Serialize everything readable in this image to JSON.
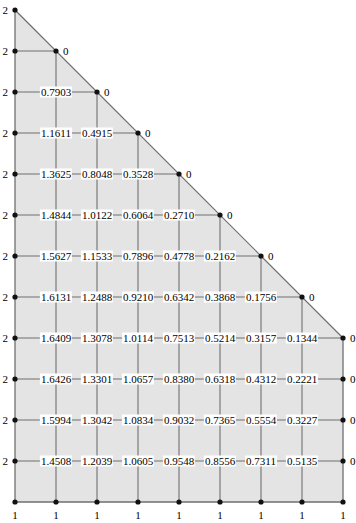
{
  "figure": {
    "type": "mesh-plot",
    "width": 356,
    "height": 523,
    "fill_color": "#e4e4e4",
    "line_color": "#6f6f6f",
    "node_color": "#111111",
    "text_color": "#000000"
  },
  "geometry": {
    "columns_x": [
      15,
      56,
      97,
      138,
      179,
      220,
      261,
      302,
      343
    ],
    "rows_y": [
      10,
      51,
      92,
      133,
      174,
      215,
      256,
      297,
      338,
      379,
      420,
      461,
      502
    ],
    "hypotenuse": {
      "from_col": 0,
      "from_row": 0,
      "to_col": 8,
      "to_row": 8
    }
  },
  "chart_data": {
    "type": "heatmap",
    "xlabel": "",
    "ylabel": "",
    "grid": true,
    "legend": "none",
    "boundary_values": {
      "left_edge": "2",
      "bottom_edge": "1",
      "diagonal_and_right_edge": "0"
    },
    "columns_x": [
      15,
      56,
      97,
      138,
      179,
      220,
      261,
      302,
      343
    ],
    "rows_y": [
      10,
      51,
      92,
      133,
      174,
      215,
      256,
      297,
      338,
      379,
      420,
      461,
      502
    ],
    "rows": [
      {
        "row": 0,
        "labels": [
          "2"
        ]
      },
      {
        "row": 1,
        "labels": [
          "2",
          "0"
        ]
      },
      {
        "row": 2,
        "labels": [
          "2",
          "0.7903",
          "0"
        ]
      },
      {
        "row": 3,
        "labels": [
          "2",
          "1.1611",
          "0.4915",
          "0"
        ]
      },
      {
        "row": 4,
        "labels": [
          "2",
          "1.3625",
          "0.8048",
          "0.3528",
          "0"
        ]
      },
      {
        "row": 5,
        "labels": [
          "2",
          "1.4844",
          "1.0122",
          "0.6064",
          "0.2710",
          "0"
        ]
      },
      {
        "row": 6,
        "labels": [
          "2",
          "1.5627",
          "1.1533",
          "0.7896",
          "0.4778",
          "0.2162",
          "0"
        ]
      },
      {
        "row": 7,
        "labels": [
          "2",
          "1.6131",
          "1.2488",
          "0.9210",
          "0.6342",
          "0.3868",
          "0.1756",
          "0"
        ]
      },
      {
        "row": 8,
        "labels": [
          "2",
          "1.6409",
          "1.3078",
          "1.0114",
          "0.7513",
          "0.5214",
          "0.3157",
          "0.1344",
          "0"
        ]
      },
      {
        "row": 9,
        "labels": [
          "2",
          "1.6426",
          "1.3301",
          "1.0657",
          "0.8380",
          "0.6318",
          "0.4312",
          "0.2221",
          "0"
        ]
      },
      {
        "row": 10,
        "labels": [
          "2",
          "1.5994",
          "1.3042",
          "1.0834",
          "0.9032",
          "0.7365",
          "0.5554",
          "0.3227",
          "0"
        ]
      },
      {
        "row": 11,
        "labels": [
          "2",
          "1.4508",
          "1.2039",
          "1.0605",
          "0.9548",
          "0.8556",
          "0.7311",
          "0.5135",
          "0"
        ]
      },
      {
        "row": 12,
        "labels": [
          "1",
          "1",
          "1",
          "1",
          "1",
          "1",
          "1",
          "1",
          "1"
        ]
      }
    ]
  }
}
